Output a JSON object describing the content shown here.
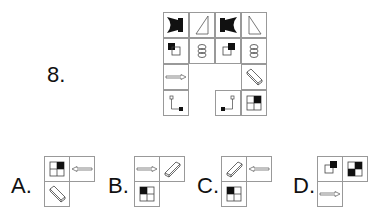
{
  "question": {
    "number_label": "8.",
    "grid": {
      "rows": 4,
      "cols": 4,
      "cells": [
        [
          {
            "icon": "bowtie-filled-left"
          },
          {
            "icon": "triangle-right"
          },
          {
            "icon": "bowtie-filled-right"
          },
          {
            "icon": "triangle-left"
          }
        ],
        [
          {
            "icon": "squares-overlap-topleft"
          },
          {
            "icon": "stacked-ovals"
          },
          {
            "icon": "squares-overlap-topright"
          },
          {
            "icon": "stacked-ovals"
          }
        ],
        [
          {
            "icon": "arrow-right"
          },
          {
            "icon": "empty-missing"
          },
          {
            "icon": "empty-missing"
          },
          {
            "icon": "prism-3d"
          }
        ],
        [
          {
            "icon": "corner-bracket-right"
          },
          {
            "icon": "empty-missing"
          },
          {
            "icon": "corner-bracket-left"
          },
          {
            "icon": "quad-square-topright"
          }
        ]
      ]
    }
  },
  "options": [
    {
      "label": "A.",
      "cells": [
        "quad-square-topright",
        "arrow-left",
        "prism-3d"
      ]
    },
    {
      "label": "B.",
      "cells": [
        "arrow-right",
        "prism-3d",
        "quad-square-topleft"
      ]
    },
    {
      "label": "C.",
      "cells": [
        "prism-3d",
        "arrow-left",
        "quad-square-topleft"
      ]
    },
    {
      "label": "D.",
      "cells": [
        "squares-overlap-topright",
        "quad-diagonal",
        "arrow-right"
      ]
    }
  ]
}
